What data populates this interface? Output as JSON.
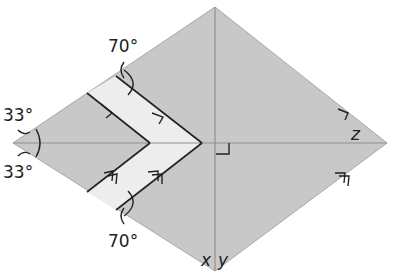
{
  "figure": {
    "type": "kite/rhombus geometric diagram with chevron strip",
    "colors": {
      "background": "#ffffff",
      "shape_fill": "#c8c8c8",
      "shape_edge": "#a8a8a8",
      "chevron_fill": "#ededed",
      "axis_line": "#8f8f8f",
      "ink": "#222222"
    },
    "vertices": {
      "top": [
        215,
        7
      ],
      "right": [
        387,
        143
      ],
      "bottom": [
        215,
        271
      ],
      "left": [
        13,
        143
      ]
    },
    "angle_labels": {
      "top_left_upper": "33°",
      "top_left_lower": "33°",
      "chevron_top": "70°",
      "chevron_bottom": "70°"
    },
    "variable_labels": {
      "z": "z",
      "x": "x",
      "y": "y"
    },
    "markers": {
      "single_arrow": "parallel-mark-single",
      "double_arrow": "parallel-mark-double",
      "right_angle": "right-angle-mark"
    }
  }
}
